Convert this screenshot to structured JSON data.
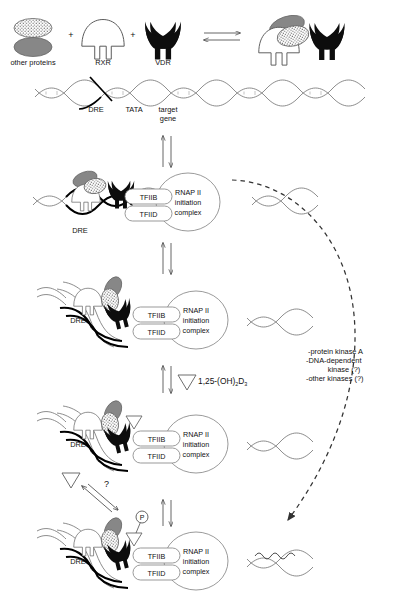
{
  "figure": {
    "colors": {
      "vdr_fill": "#0d0d0d",
      "rxr_fill": "#ffffff",
      "rxr_stroke": "#555555",
      "other_protein_gray": "#878787",
      "other_protein_stipple": "#ffffff",
      "dna_stroke": "#777777",
      "dna_dre_stroke": "#000000",
      "dashed_arrow": "#333333",
      "text": "#111111"
    }
  },
  "top_row": {
    "other_proteins_label": "other proteins",
    "rxr_label": "RXR",
    "vdr_label": "VDR",
    "plus_1": "+",
    "plus_2": "+"
  },
  "dna_track": {
    "dre_label": "DRE",
    "tata_label": "TATA",
    "target_gene_label_line1": "target",
    "target_gene_label_line2": "gene"
  },
  "complex_labels": {
    "tfiib": "TFIIB",
    "tfiid": "TFIID",
    "rnap_line1": "RNAP II",
    "rnap_line2": "initiation",
    "rnap_line3": "complex",
    "dre": "DRE"
  },
  "panels": [
    {
      "id": "panel-1-linear-dna",
      "dre_label": "DRE",
      "tfiib": "TFIIB",
      "tfiid": "TFIID",
      "rnap_line1": "RNAP II",
      "rnap_line2": "initiation",
      "rnap_line3": "complex"
    },
    {
      "id": "panel-2-looped-dna",
      "dre_label": "DRE",
      "tfiib": "TFIIB",
      "tfiid": "TFIID",
      "rnap_line1": "RNAP II",
      "rnap_line2": "initiation",
      "rnap_line3": "complex"
    },
    {
      "id": "panel-3-ligand-bound",
      "dre_label": "DRE",
      "tfiib": "TFIIB",
      "tfiid": "TFIID",
      "rnap_line1": "RNAP II",
      "rnap_line2": "initiation",
      "rnap_line3": "complex"
    },
    {
      "id": "panel-4-phosphorylated",
      "dre_label": "DRE",
      "tfiib": "TFIIB",
      "tfiid": "TFIID",
      "rnap_line1": "RNAP II",
      "rnap_line2": "initiation",
      "rnap_line3": "complex"
    }
  ],
  "annotations": {
    "ligand_name": "1,25-(OH)",
    "ligand_sub_1": "2",
    "ligand_mid": "D",
    "ligand_sub_2": "3",
    "question_mark": "?",
    "phosphate": "P"
  },
  "kinases": {
    "line1": "-protein kinase A",
    "line2": "-DNA-dependent",
    "line3": "kinase (?)",
    "line4": "-other kinases (?)"
  }
}
